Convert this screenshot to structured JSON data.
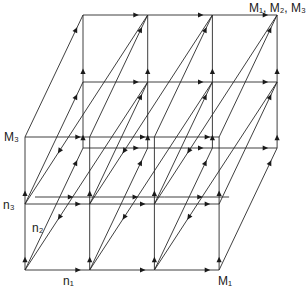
{
  "figure": {
    "type": "3d-lattice-flow-diagram",
    "background": "#ffffff",
    "line_color": "#2a2a2a",
    "labels": {
      "corner_top_right": "M₁, M₂, M₃",
      "axis_x_end": "M₁",
      "axis_z_end": "M₃",
      "n1": "n₁",
      "n2": "n₂",
      "n3": "n₃"
    },
    "grid": {
      "origin": [
        25,
        270
      ],
      "x_step": 64.7,
      "x_count": 3,
      "z_levels_y": [
        270,
        204,
        137
      ],
      "depth_back_offset": [
        58,
        -122
      ],
      "depth_mid_offset": [
        10,
        -7
      ]
    }
  }
}
